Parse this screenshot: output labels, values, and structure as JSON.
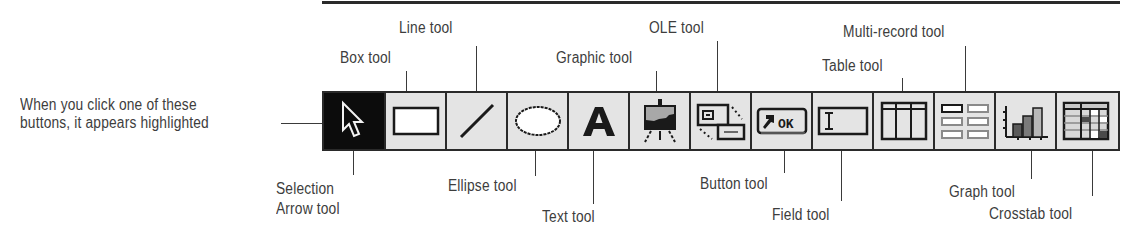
{
  "diagram": {
    "type": "toolbar-callout",
    "note": "When you click one of these buttons, it appears highlighted",
    "note_lines": [
      "When you click one of these",
      "buttons, it appears highlighted"
    ],
    "toolbar": {
      "buttons": [
        {
          "id": "selection",
          "label": "Selection Arrow tool",
          "label_lines": [
            "Selection",
            "Arrow tool"
          ],
          "icon": "arrow-cursor-icon",
          "selected": true
        },
        {
          "id": "box",
          "label": "Box tool",
          "icon": "rectangle-icon",
          "selected": false
        },
        {
          "id": "line",
          "label": "Line tool",
          "icon": "line-icon",
          "selected": false
        },
        {
          "id": "ellipse",
          "label": "Ellipse tool",
          "icon": "ellipse-icon",
          "selected": false
        },
        {
          "id": "text",
          "label": "Text tool",
          "icon": "letter-a-icon",
          "glyph": "A",
          "selected": false
        },
        {
          "id": "graphic",
          "label": "Graphic tool",
          "icon": "easel-icon",
          "selected": false
        },
        {
          "id": "ole",
          "label": "OLE tool",
          "icon": "linked-windows-icon",
          "selected": false
        },
        {
          "id": "button",
          "label": "Button tool",
          "icon": "ok-button-icon",
          "glyph": "OK",
          "selected": false
        },
        {
          "id": "field",
          "label": "Field tool",
          "icon": "text-field-icon",
          "selected": false
        },
        {
          "id": "table",
          "label": "Table tool",
          "icon": "table-icon",
          "selected": false
        },
        {
          "id": "multirecord",
          "label": "Multi-record tool",
          "icon": "multi-record-icon",
          "selected": false
        },
        {
          "id": "graph",
          "label": "Graph tool",
          "icon": "bar-chart-icon",
          "selected": false
        },
        {
          "id": "crosstab",
          "label": "Crosstab tool",
          "icon": "crosstab-grid-icon",
          "selected": false
        }
      ]
    },
    "colors": {
      "selected_bg": "#0c0c0c",
      "button_bg": "#e4e4e4",
      "border": "#2a2a2a",
      "text": "#3d3d3d"
    }
  }
}
